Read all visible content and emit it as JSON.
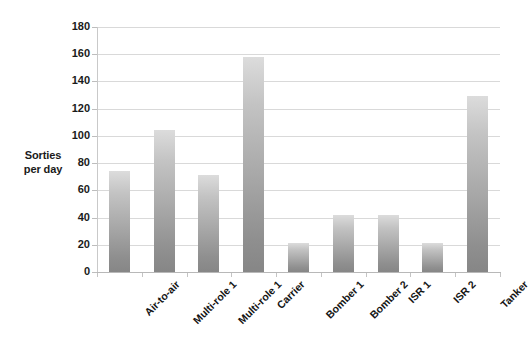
{
  "chart_data": {
    "type": "bar",
    "title": "",
    "subtitle": "",
    "xlabel": "",
    "ylabel": "Sorties per day",
    "ylabel_lines": [
      "Sorties",
      "per day"
    ],
    "categories": [
      "Air-to-air",
      "Multi-role 1",
      "Multi-role 1",
      "Carrier",
      "Bomber 1",
      "Bomber 2",
      "ISR 1",
      "ISR 2",
      "Tanker"
    ],
    "values": [
      74,
      104,
      71,
      158,
      21,
      42,
      42,
      21,
      129
    ],
    "ylim": [
      0,
      180
    ],
    "ytick_step": 20,
    "yticks": [
      0,
      20,
      40,
      60,
      80,
      100,
      120,
      140,
      160,
      180
    ],
    "ytick_labels": [
      "0",
      "20",
      "40",
      "60",
      "80",
      "100",
      "120",
      "140",
      "160",
      "180"
    ],
    "grid": "horizontal",
    "legend": "none",
    "bar_color_top": "#dcdcdc",
    "bar_color_bottom": "#868686",
    "gridline_color": "#d9d9d9",
    "axis_color": "#bdbdbd",
    "background": "#ffffff"
  }
}
